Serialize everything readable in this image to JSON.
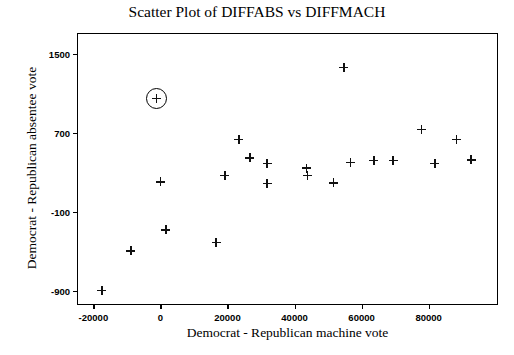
{
  "chart_data": {
    "type": "scatter",
    "title": "Scatter Plot of DIFFABS vs DIFFMACH",
    "xlabel": "Democrat - Republican machine vote",
    "ylabel": "Democrat - Republican absentee vote",
    "xlim": [
      -24600,
      101000
    ],
    "ylim": [
      -1050,
      1700
    ],
    "xticks": [
      -20000,
      0,
      20000,
      40000,
      60000,
      80000
    ],
    "xtick_labels": [
      "-20000",
      "0",
      "20000",
      "40000",
      "60000",
      "80000"
    ],
    "yticks": [
      1500,
      700,
      -100,
      -900
    ],
    "ytick_labels": [
      "1500",
      "700",
      "-100",
      "-900"
    ],
    "grid": false,
    "legend": null,
    "marker": "plus",
    "marker_color": "#111111",
    "frame_color": "#000000",
    "points": [
      {
        "x": -1150,
        "y": 1046,
        "highlighted": true
      },
      {
        "x": 54700,
        "y": 1360,
        "highlighted": false
      },
      {
        "x": 77900,
        "y": 735,
        "highlighted": false
      },
      {
        "x": 88400,
        "y": 633,
        "highlighted": false
      },
      {
        "x": 23400,
        "y": 633,
        "highlighted": false
      },
      {
        "x": 26700,
        "y": 447,
        "highlighted": false
      },
      {
        "x": 31800,
        "y": 391,
        "highlighted": false
      },
      {
        "x": 19200,
        "y": 270,
        "highlighted": false
      },
      {
        "x": 31800,
        "y": 186,
        "highlighted": false
      },
      {
        "x": 43500,
        "y": 344,
        "highlighted": false
      },
      {
        "x": 43800,
        "y": 270,
        "highlighted": false
      },
      {
        "x": 51700,
        "y": 195,
        "highlighted": false
      },
      {
        "x": 56700,
        "y": 400,
        "highlighted": false
      },
      {
        "x": 63700,
        "y": 419,
        "highlighted": false
      },
      {
        "x": 69400,
        "y": 419,
        "highlighted": false
      },
      {
        "x": 81900,
        "y": 391,
        "highlighted": false
      },
      {
        "x": 92700,
        "y": 428,
        "highlighted": false
      },
      {
        "x": 0,
        "y": 205,
        "highlighted": false
      },
      {
        "x": 1600,
        "y": -280,
        "highlighted": false
      },
      {
        "x": 16600,
        "y": -410,
        "highlighted": false
      },
      {
        "x": -8800,
        "y": -493,
        "highlighted": false
      },
      {
        "x": -17500,
        "y": -893,
        "highlighted": false
      }
    ]
  }
}
